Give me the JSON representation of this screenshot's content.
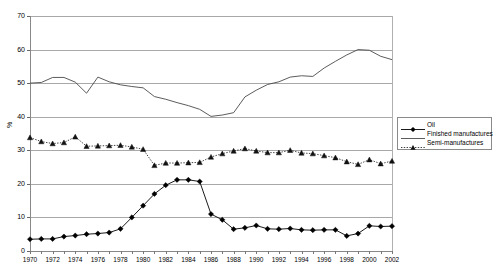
{
  "chart_data": {
    "type": "line",
    "title": "",
    "xlabel": "",
    "ylabel": "%",
    "ylim": [
      0,
      70
    ],
    "ytick_step": 10,
    "yticks": [
      0,
      10,
      20,
      30,
      40,
      50,
      60,
      70
    ],
    "grid": true,
    "legend_position": "right",
    "x": [
      1970,
      1971,
      1972,
      1973,
      1974,
      1975,
      1976,
      1977,
      1978,
      1979,
      1980,
      1981,
      1982,
      1983,
      1984,
      1985,
      1986,
      1987,
      1988,
      1989,
      1990,
      1991,
      1992,
      1993,
      1994,
      1995,
      1996,
      1997,
      1998,
      1999,
      2000,
      2001,
      2002
    ],
    "xtick_labels": [
      "1970",
      "1972",
      "1974",
      "1976",
      "1978",
      "1980",
      "1982",
      "1984",
      "1986",
      "1988",
      "1990",
      "1992",
      "1994",
      "1996",
      "1998",
      "2000",
      "2002"
    ],
    "series": [
      {
        "name": "Oil",
        "marker": "diamond",
        "linestyle": "solid",
        "color": "#000000",
        "values": [
          3.5,
          3.6,
          3.6,
          4.3,
          4.6,
          5.0,
          5.2,
          5.5,
          6.6,
          10.0,
          13.5,
          17.0,
          19.6,
          21.2,
          21.2,
          20.7,
          11.0,
          9.3,
          6.5,
          6.9,
          7.6,
          6.6,
          6.5,
          6.7,
          6.3,
          6.2,
          6.3,
          6.3,
          4.5,
          5.2,
          7.5,
          7.3,
          7.4
        ]
      },
      {
        "name": "Finished manufactures",
        "marker": "none",
        "linestyle": "solid",
        "color": "#4a4a4a",
        "values": [
          50.0,
          50.2,
          51.7,
          51.7,
          50.3,
          47.0,
          51.8,
          50.4,
          49.5,
          49.0,
          48.6,
          46.0,
          45.2,
          44.2,
          43.3,
          42.2,
          40.1,
          40.5,
          41.2,
          45.9,
          47.9,
          49.6,
          50.4,
          51.8,
          52.2,
          52.0,
          54.5,
          56.5,
          58.4,
          60.0,
          59.8,
          58.0,
          57.0
        ]
      },
      {
        "name": "Semi-manufactures",
        "marker": "triangle",
        "linestyle": "dotted",
        "color": "#111111",
        "values": [
          33.8,
          32.6,
          32.0,
          32.3,
          34.0,
          31.2,
          31.3,
          31.4,
          31.5,
          31.0,
          30.3,
          25.5,
          26.2,
          26.2,
          26.3,
          26.4,
          28.0,
          29.0,
          29.8,
          30.5,
          29.8,
          29.3,
          29.3,
          30.0,
          29.2,
          29.0,
          28.4,
          27.8,
          26.6,
          25.8,
          27.2,
          26.0,
          26.8
        ]
      }
    ]
  },
  "legend": {
    "items": [
      {
        "label": "Oil"
      },
      {
        "label": "Finished manufactures"
      },
      {
        "label": "Semi-manufactures"
      }
    ]
  },
  "axes": {
    "y_title": "%"
  }
}
